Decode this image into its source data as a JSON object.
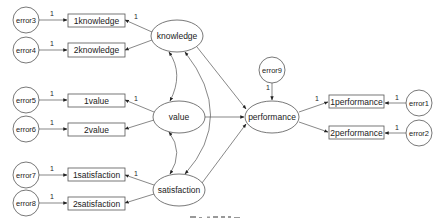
{
  "diagram": {
    "type": "structural-equation-model",
    "latent": [
      {
        "id": "knowledge",
        "label": "knowledge"
      },
      {
        "id": "value",
        "label": "value"
      },
      {
        "id": "satisfaction",
        "label": "satisfaction"
      },
      {
        "id": "performance",
        "label": "performance"
      }
    ],
    "observed": [
      {
        "id": "k1",
        "label": "1knowledge"
      },
      {
        "id": "k2",
        "label": "2knowledge"
      },
      {
        "id": "v1",
        "label": "1value"
      },
      {
        "id": "v2",
        "label": "2value"
      },
      {
        "id": "s1",
        "label": "1satisfaction"
      },
      {
        "id": "s2",
        "label": "2satisfaction"
      },
      {
        "id": "p1",
        "label": "1performance"
      },
      {
        "id": "p2",
        "label": "2performance"
      }
    ],
    "errors": [
      {
        "id": "e1",
        "label": "error1"
      },
      {
        "id": "e2",
        "label": "error2"
      },
      {
        "id": "e3",
        "label": "error3"
      },
      {
        "id": "e4",
        "label": "error4"
      },
      {
        "id": "e5",
        "label": "error5"
      },
      {
        "id": "e6",
        "label": "error6"
      },
      {
        "id": "e7",
        "label": "error7"
      },
      {
        "id": "e8",
        "label": "error8"
      },
      {
        "id": "e9",
        "label": "error9"
      }
    ],
    "coefficient_label": "1",
    "paths": [
      {
        "from": "knowledge",
        "to": "performance"
      },
      {
        "from": "value",
        "to": "performance"
      },
      {
        "from": "satisfaction",
        "to": "performance"
      }
    ],
    "covariances": [
      [
        "knowledge",
        "value"
      ],
      [
        "value",
        "satisfaction"
      ],
      [
        "knowledge",
        "satisfaction"
      ]
    ]
  }
}
